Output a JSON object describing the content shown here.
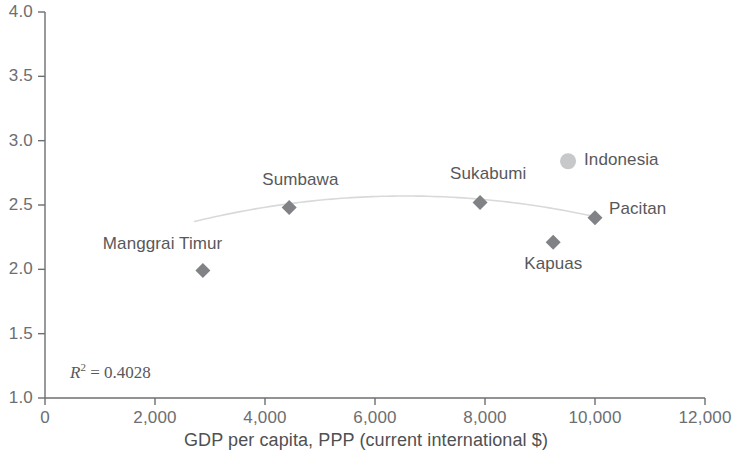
{
  "chart_data": {
    "type": "scatter",
    "title": "",
    "xlabel": "GDP per capita, PPP (current international $)",
    "ylabel": "",
    "xlim": [
      0,
      12000
    ],
    "ylim": [
      1.0,
      4.0
    ],
    "grid": false,
    "legend": "none",
    "annotations": {
      "r2_symbol": "R",
      "r2_exponent": "2",
      "r2_equals": " = ",
      "r2_value": "0.4028",
      "r2_full": "R2 = 0.4028"
    },
    "xticks": [
      {
        "value": 0,
        "label": "0"
      },
      {
        "value": 2000,
        "label": "2,000"
      },
      {
        "value": 4000,
        "label": "4,000"
      },
      {
        "value": 6000,
        "label": "6,000"
      },
      {
        "value": 8000,
        "label": "8,000"
      },
      {
        "value": 10000,
        "label": "10,000"
      },
      {
        "value": 12000,
        "label": "12,000"
      }
    ],
    "yticks": [
      {
        "value": 1.0,
        "label": "1.0"
      },
      {
        "value": 1.5,
        "label": "1.5"
      },
      {
        "value": 2.0,
        "label": "2.0"
      },
      {
        "value": 2.5,
        "label": "2.5"
      },
      {
        "value": 3.0,
        "label": "3.0"
      },
      {
        "value": 3.5,
        "label": "3.5"
      },
      {
        "value": 4.0,
        "label": "4.0"
      }
    ],
    "series": [
      {
        "name": "Districts",
        "marker": "diamond",
        "color": "#808285",
        "points": [
          {
            "label": "Manggrai Timur",
            "x": 2870,
            "y": 1.99,
            "label_dx": -100,
            "label_dy": -27
          },
          {
            "label": "Sumbawa",
            "x": 4440,
            "y": 2.48,
            "label_dx": -27,
            "label_dy": -28
          },
          {
            "label": "Sukabumi",
            "x": 7910,
            "y": 2.52,
            "label_dx": -30,
            "label_dy": -28
          },
          {
            "label": "Kapuas",
            "x": 9240,
            "y": 2.21,
            "label_dx": -29,
            "label_dy": 22
          },
          {
            "label": "Pacitan",
            "x": 10000,
            "y": 2.4,
            "label_dx": 14,
            "label_dy": -9
          }
        ]
      },
      {
        "name": "National",
        "marker": "circle",
        "color": "#bcbec0",
        "points": [
          {
            "label": "Indonesia",
            "x": 9510,
            "y": 2.84,
            "label_dx": 16,
            "label_dy": -1
          }
        ]
      }
    ],
    "trendline": {
      "type": "quadratic-fit",
      "color": "#d8d9da",
      "x_start": 2720,
      "x_end": 10090,
      "vertex_x": 6550,
      "vertex_y": 2.57,
      "curvature": -1.35e-08
    }
  },
  "colors": {
    "axis": "#6d6e71",
    "marker_primary": "#808285",
    "marker_secondary": "#bcbec0",
    "trendline": "#d8d9da",
    "text": "#58585a",
    "background": "#ffffff"
  }
}
